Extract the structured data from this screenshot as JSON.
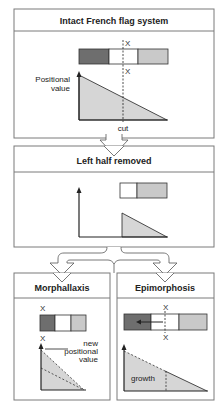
{
  "colors": {
    "dark": "#6e6e6e",
    "white": "#ffffff",
    "light": "#c9c9c9",
    "fill": "#d6d6d6",
    "border": "#7a7a7a",
    "line": "#222222"
  },
  "panels": {
    "intact": {
      "title": "Intact French flag system",
      "axis_label_line1": "Positional",
      "axis_label_line2": "value",
      "cut_label": "cut",
      "marker_top": "X",
      "marker_bottom": "X"
    },
    "left_half": {
      "title": "Left half removed"
    },
    "morphallaxis": {
      "title": "Morphallaxis",
      "marker_top": "X",
      "marker_bottom": "X",
      "annotation_line1": "new",
      "annotation_line2": "positional",
      "annotation_line3": "value"
    },
    "epimorphosis": {
      "title": "Epimorphosis",
      "marker_top": "X",
      "marker_bottom": "X",
      "growth_label": "growth"
    }
  }
}
